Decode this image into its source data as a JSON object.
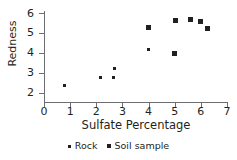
{
  "chart_data": {
    "type": "scatter",
    "title": "",
    "xlabel": "Sulfate Percentage",
    "ylabel": "Redness",
    "xlim": [
      0,
      7
    ],
    "ylim": [
      1.6,
      6.2
    ],
    "xticks": [
      0,
      1,
      2,
      3,
      4,
      5,
      6,
      7
    ],
    "yticks": [
      2,
      3,
      4,
      5,
      6
    ],
    "grid": false,
    "legend_position": "bottom",
    "series": [
      {
        "name": "Rock",
        "marker": "small-dot",
        "color": "#231f20",
        "points": [
          {
            "x": 0.77,
            "y": 2.35
          },
          {
            "x": 2.15,
            "y": 2.75
          },
          {
            "x": 2.64,
            "y": 2.75
          },
          {
            "x": 2.68,
            "y": 3.2
          },
          {
            "x": 4.0,
            "y": 4.15
          }
        ]
      },
      {
        "name": "Soil sample",
        "marker": "square",
        "color": "#231f20",
        "points": [
          {
            "x": 4.0,
            "y": 5.27
          },
          {
            "x": 4.98,
            "y": 3.97
          },
          {
            "x": 5.02,
            "y": 5.6
          },
          {
            "x": 5.6,
            "y": 5.67
          },
          {
            "x": 6.0,
            "y": 5.55
          },
          {
            "x": 6.25,
            "y": 5.2
          }
        ]
      }
    ]
  },
  "axes": {
    "y_tick_labels": [
      "6",
      "5",
      "4",
      "3",
      "2"
    ],
    "x_tick_labels": [
      "0",
      "1",
      "2",
      "3",
      "4",
      "5",
      "6",
      "7"
    ],
    "y_axis_title": "Redness",
    "x_axis_title": "Sulfate Percentage"
  },
  "legend": {
    "items": [
      {
        "label": "Rock",
        "marker": "small-dot"
      },
      {
        "label": "Soil sample",
        "marker": "square"
      }
    ]
  },
  "colors": {
    "marker": "#231f20",
    "axis": "#6d6e71",
    "background": "#ffffff"
  }
}
